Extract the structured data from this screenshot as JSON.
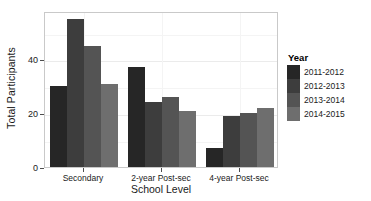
{
  "chart_data": {
    "type": "bar",
    "title": "",
    "xlabel": "School Level",
    "ylabel": "Total Participants",
    "categories": [
      "Secondary",
      "2-year Post-sec",
      "4-year Post-sec"
    ],
    "series": [
      {
        "name": "2011-2012",
        "values": [
          30,
          37,
          7
        ],
        "color": "#262626"
      },
      {
        "name": "2012-2013",
        "values": [
          55,
          24,
          19
        ],
        "color": "#3d3d3d"
      },
      {
        "name": "2013-2014",
        "values": [
          45,
          26,
          20
        ],
        "color": "#545454"
      },
      {
        "name": "2014-2015",
        "values": [
          31,
          21,
          22
        ],
        "color": "#6e6e6e"
      }
    ],
    "ylim": [
      0,
      58
    ],
    "yticks": [
      0,
      20,
      40
    ],
    "ytick_labels": [
      "0",
      "20",
      "40"
    ],
    "grid": true,
    "legend_title": "Year",
    "legend_position": "right"
  },
  "legend": {
    "title": "Year",
    "items": [
      {
        "label": "2011-2012",
        "color": "#262626"
      },
      {
        "label": "2012-2013",
        "color": "#3d3d3d"
      },
      {
        "label": "2013-2014",
        "color": "#545454"
      },
      {
        "label": "2014-2015",
        "color": "#6e6e6e"
      }
    ]
  },
  "axes": {
    "y_title": "Total Participants",
    "x_title": "School Level",
    "y_tick_labels": [
      "0",
      "20",
      "40"
    ],
    "x_tick_labels": [
      "Secondary",
      "2-year Post-sec",
      "4-year Post-sec"
    ]
  }
}
